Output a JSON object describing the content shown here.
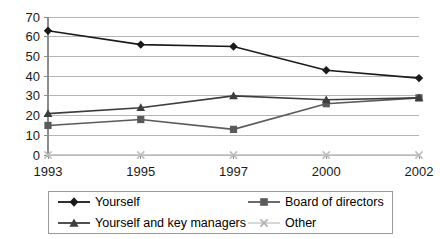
{
  "chart_data": {
    "type": "line",
    "title": "",
    "subtitle": "",
    "xlabel": "",
    "ylabel": "",
    "categories": [
      "1993",
      "1995",
      "1997",
      "2000",
      "2002"
    ],
    "x": [
      1993,
      1995,
      1997,
      2000,
      2002
    ],
    "ylim": [
      0,
      70
    ],
    "yticks": [
      0,
      10,
      20,
      30,
      40,
      50,
      60,
      70
    ],
    "ytick_labels": [
      "0",
      "10",
      "20",
      "30",
      "40",
      "50",
      "60",
      "70"
    ],
    "grid": "horizontal",
    "legend_position": "bottom",
    "series": [
      {
        "name": "Yourself",
        "marker": "diamond",
        "color": "#1a1a1a",
        "values": [
          63,
          56,
          55,
          43,
          39
        ]
      },
      {
        "name": "Board of directors",
        "marker": "square",
        "color": "#5a5a5a",
        "values": [
          15,
          18,
          13,
          26,
          29
        ]
      },
      {
        "name": "Yourself and key managers",
        "marker": "triangle",
        "color": "#3d3d3d",
        "values": [
          21,
          24,
          30,
          28,
          29
        ]
      },
      {
        "name": "Other",
        "marker": "cross-x",
        "color": "#bdbdbd",
        "values": [
          0,
          0,
          0,
          0,
          0
        ]
      }
    ]
  },
  "legend": {
    "entries": [
      {
        "label": "Yourself",
        "marker": "diamond",
        "color": "#1a1a1a"
      },
      {
        "label": "Board of directors",
        "marker": "square",
        "color": "#5a5a5a"
      },
      {
        "label": "Yourself and key managers",
        "marker": "triangle",
        "color": "#3d3d3d"
      },
      {
        "label": "Other",
        "marker": "cross-x",
        "color": "#bdbdbd"
      }
    ]
  },
  "axes": {
    "y_tick_labels": [
      "70",
      "60",
      "50",
      "40",
      "30",
      "20",
      "10",
      "0"
    ],
    "x_tick_labels": [
      "1993",
      "1995",
      "1997",
      "2000",
      "2002"
    ]
  }
}
